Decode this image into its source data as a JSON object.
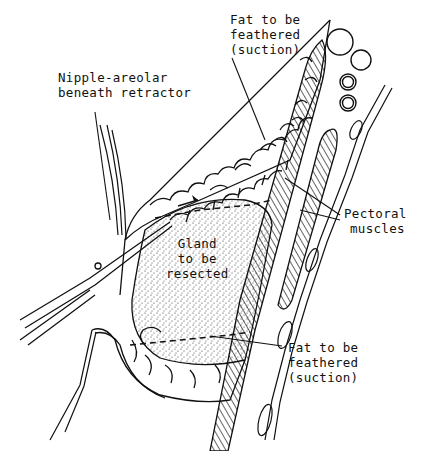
{
  "figure": {
    "labels": {
      "fat_top": [
        "Fat to be",
        "feathered",
        "(suction)"
      ],
      "nipple": [
        "Nipple-areolar",
        "beneath retractor"
      ],
      "pectoral": [
        "Pectoral",
        "muscles"
      ],
      "gland": [
        "Gland",
        "to be",
        "resected"
      ],
      "fat_bottom": [
        "Fat to be",
        "feathered",
        "(suction)"
      ]
    },
    "colors": {
      "ink": "#111111",
      "background": "#ffffff"
    }
  }
}
